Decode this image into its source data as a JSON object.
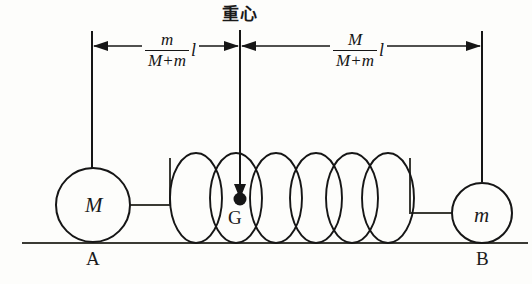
{
  "diagram": {
    "title_label": "重心",
    "center_point_label": "G",
    "left_mass_label": "M",
    "right_mass_label": "m",
    "left_ground_label": "A",
    "right_ground_label": "B",
    "left_dimension": {
      "numerator": "m",
      "denominator_left": "M",
      "denominator_op": "+",
      "denominator_right": "m",
      "length_symbol": "l"
    },
    "right_dimension": {
      "numerator": "M",
      "denominator_left": "M",
      "denominator_op": "+",
      "denominator_right": "m",
      "length_symbol": "l"
    },
    "colors": {
      "ink": "#161616",
      "background": "#fdfdfb"
    },
    "spring": {
      "coil_count": 6
    }
  }
}
